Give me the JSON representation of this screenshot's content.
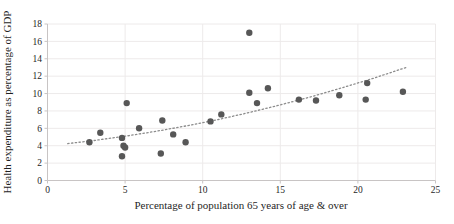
{
  "figure": {
    "width": 454,
    "height": 224,
    "background": "#ffffff"
  },
  "chart_data": {
    "type": "scatter",
    "title": "",
    "xlabel": "Percentage of population 65 years of age & over",
    "ylabel": "Health expenditure as percentage of GDP",
    "xlim": [
      0,
      25
    ],
    "ylim": [
      0,
      18
    ],
    "x_ticks": [
      0,
      5,
      10,
      15,
      20,
      25
    ],
    "y_ticks": [
      0,
      2,
      4,
      6,
      8,
      10,
      12,
      14,
      16,
      18
    ],
    "grid": true,
    "legend": "none",
    "points": [
      [
        2.7,
        4.4
      ],
      [
        3.4,
        5.5
      ],
      [
        4.8,
        4.9
      ],
      [
        4.9,
        4.0
      ],
      [
        5.0,
        3.8
      ],
      [
        4.8,
        2.8
      ],
      [
        5.1,
        8.9
      ],
      [
        5.9,
        6.0
      ],
      [
        7.3,
        3.1
      ],
      [
        7.4,
        6.9
      ],
      [
        8.1,
        5.3
      ],
      [
        8.9,
        4.4
      ],
      [
        10.5,
        6.8
      ],
      [
        11.2,
        7.6
      ],
      [
        13.0,
        10.1
      ],
      [
        13.0,
        17.0
      ],
      [
        13.5,
        8.9
      ],
      [
        14.2,
        10.6
      ],
      [
        16.2,
        9.3
      ],
      [
        17.3,
        9.2
      ],
      [
        18.8,
        9.8
      ],
      [
        20.5,
        9.3
      ],
      [
        20.6,
        11.2
      ],
      [
        22.9,
        10.2
      ]
    ],
    "trendline": {
      "style": "dotted",
      "points": [
        [
          1.3,
          4.24
        ],
        [
          3,
          4.6
        ],
        [
          5,
          5.09
        ],
        [
          7,
          5.66
        ],
        [
          9,
          6.3
        ],
        [
          11,
          7.02
        ],
        [
          13,
          7.82
        ],
        [
          15,
          8.69
        ],
        [
          17,
          9.64
        ],
        [
          19,
          10.67
        ],
        [
          21,
          11.76
        ],
        [
          23.2,
          13.06
        ]
      ]
    },
    "colors": {
      "point": "#575757",
      "trend": "#8c8c8c",
      "grid": "#edeaea",
      "axis": "#c8c4c4",
      "text": "#1f1f1f"
    }
  }
}
